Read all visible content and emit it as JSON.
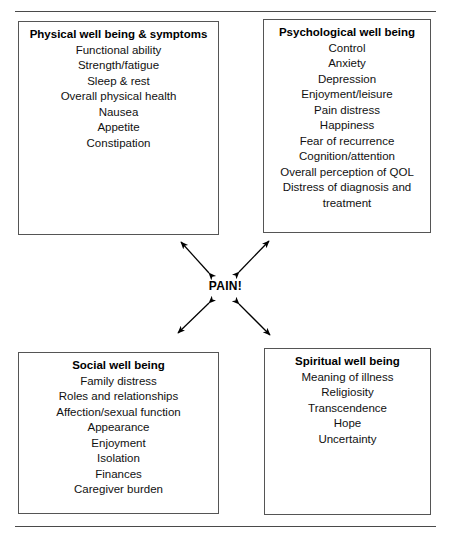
{
  "figure": {
    "center_label": "PAIN!",
    "rules": {
      "top_label": "top-divider-rule",
      "bottom_label": "bottom-divider-rule"
    }
  },
  "quadrants": [
    {
      "key": "physical",
      "title": "Physical well being & symptoms",
      "items": [
        "Functional ability",
        "Strength/fatigue",
        "Sleep & rest",
        "Overall physical health",
        "Nausea",
        "Appetite",
        "Constipation"
      ]
    },
    {
      "key": "psychological",
      "title": "Psychological well being",
      "items": [
        "Control",
        "Anxiety",
        "Depression",
        "Enjoyment/leisure",
        "Pain distress",
        "Happiness",
        "Fear of recurrence",
        "Cognition/attention",
        "Overall perception of QOL",
        "Distress of diagnosis and treatment"
      ]
    },
    {
      "key": "social",
      "title": "Social well being",
      "items": [
        "Family distress",
        "Roles and relationships",
        "Affection/sexual function",
        "Appearance",
        "Enjoyment",
        "Isolation",
        "Finances",
        "Caregiver burden"
      ]
    },
    {
      "key": "spiritual",
      "title": "Spiritual well being",
      "items": [
        "Meaning of illness",
        "Religiosity",
        "Transcendence",
        "Hope",
        "Uncertainty"
      ]
    }
  ],
  "connectors": [
    {
      "name": "arrow-pain-to-physical",
      "from": [
        209,
        273
      ],
      "to": [
        181,
        242
      ]
    },
    {
      "name": "arrow-pain-to-psychological",
      "from": [
        239,
        272
      ],
      "to": [
        269,
        241
      ]
    },
    {
      "name": "arrow-pain-to-social",
      "from": [
        209,
        303
      ],
      "to": [
        178,
        333
      ]
    },
    {
      "name": "arrow-pain-to-spiritual",
      "from": [
        239,
        304
      ],
      "to": [
        270,
        335
      ]
    }
  ],
  "colors": {
    "box_border": "#555555",
    "rule": "#4a4a4a",
    "text": "#111111",
    "arrow": "#000000",
    "background": "#ffffff"
  }
}
